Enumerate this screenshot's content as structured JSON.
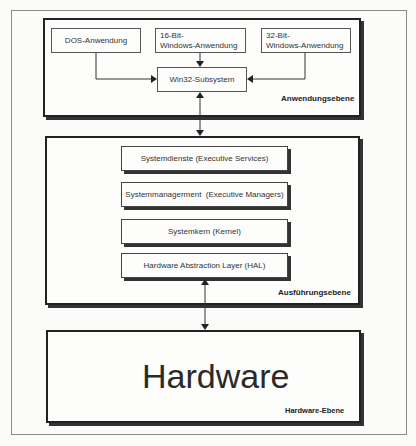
{
  "diagram": {
    "type": "layered-architecture",
    "layers": [
      {
        "id": "application",
        "label": "Anwendungsebene",
        "components": [
          {
            "id": "dos",
            "label": "DOS-Anwendung"
          },
          {
            "id": "win16",
            "label_line1": "16-Bit-",
            "label_line2": "Windows-Anwendung"
          },
          {
            "id": "win32app",
            "label_line1": "32-Bit-",
            "label_line2": "Windows-Anwendung"
          },
          {
            "id": "win32sub",
            "label": "Win32-Subsystem"
          }
        ]
      },
      {
        "id": "execution",
        "label": "Ausführungsebene",
        "components": [
          {
            "id": "services",
            "label": "Systemdienste (Executive Services)"
          },
          {
            "id": "managers",
            "label": "Systemmanagerment  (Executive Managers)"
          },
          {
            "id": "kernel",
            "label": "Systemkern (Kernel)"
          },
          {
            "id": "hal",
            "label": "Hardware Abstraction Layer (HAL)"
          }
        ]
      },
      {
        "id": "hardware",
        "label": "Hardware-Ebene",
        "title": "Hardware"
      }
    ],
    "edges": [
      {
        "from": "dos",
        "to": "win32sub",
        "direction": "forward"
      },
      {
        "from": "win16",
        "to": "win32sub",
        "direction": "forward"
      },
      {
        "from": "win32app",
        "to": "win32sub",
        "direction": "forward"
      },
      {
        "from": "win32sub",
        "to": "execution",
        "direction": "bidirectional"
      },
      {
        "from": "hal",
        "to": "hardware",
        "direction": "bidirectional"
      }
    ]
  }
}
